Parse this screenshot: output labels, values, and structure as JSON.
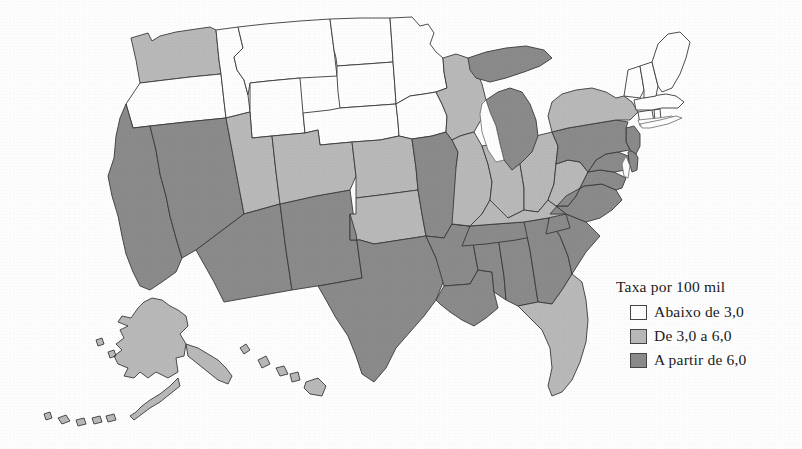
{
  "figure": {
    "kind": "choropleth-map",
    "region": "Estados Unidos"
  },
  "legend": {
    "title": "Taxa por 100 mil",
    "items": [
      {
        "label": "Abaixo de 3,0",
        "color": "#fdfdfd",
        "swatch_name": "swatch-low"
      },
      {
        "label": "De 3,0 a 6,0",
        "color": "#b8b8b8",
        "swatch_name": "swatch-mid"
      },
      {
        "label": "A partir de 6,0",
        "color": "#8a8a8a",
        "swatch_name": "swatch-high"
      }
    ]
  },
  "colors": {
    "low": "#fdfdfd",
    "mid": "#b8b8b8",
    "high": "#8a8a8a",
    "border": "#3a3a3a",
    "background": "#fdfdfd"
  },
  "map_data": {
    "type": "choropleth",
    "classes": [
      "Abaixo de 3,0",
      "De 3,0 a 6,0",
      "A partir de 6,0"
    ],
    "states": [
      {
        "code": "WA",
        "class": "De 3,0 a 6,0",
        "color": "#b8b8b8"
      },
      {
        "code": "OR",
        "class": "Abaixo de 3,0",
        "color": "#fdfdfd"
      },
      {
        "code": "ID",
        "class": "Abaixo de 3,0",
        "color": "#fdfdfd"
      },
      {
        "code": "MT",
        "class": "Abaixo de 3,0",
        "color": "#fdfdfd"
      },
      {
        "code": "WY",
        "class": "Abaixo de 3,0",
        "color": "#fdfdfd"
      },
      {
        "code": "ND",
        "class": "Abaixo de 3,0",
        "color": "#fdfdfd"
      },
      {
        "code": "SD",
        "class": "Abaixo de 3,0",
        "color": "#fdfdfd"
      },
      {
        "code": "NE",
        "class": "Abaixo de 3,0",
        "color": "#fdfdfd"
      },
      {
        "code": "MN",
        "class": "Abaixo de 3,0",
        "color": "#fdfdfd"
      },
      {
        "code": "IA",
        "class": "Abaixo de 3,0",
        "color": "#fdfdfd"
      },
      {
        "code": "CA",
        "class": "A partir de 6,0",
        "color": "#8a8a8a"
      },
      {
        "code": "NV",
        "class": "A partir de 6,0",
        "color": "#8a8a8a"
      },
      {
        "code": "UT",
        "class": "De 3,0 a 6,0",
        "color": "#b8b8b8"
      },
      {
        "code": "AZ",
        "class": "A partir de 6,0",
        "color": "#8a8a8a"
      },
      {
        "code": "NM",
        "class": "A partir de 6,0",
        "color": "#8a8a8a"
      },
      {
        "code": "CO",
        "class": "De 3,0 a 6,0",
        "color": "#b8b8b8"
      },
      {
        "code": "KS",
        "class": "De 3,0 a 6,0",
        "color": "#b8b8b8"
      },
      {
        "code": "OK",
        "class": "De 3,0 a 6,0",
        "color": "#b8b8b8"
      },
      {
        "code": "TX",
        "class": "A partir de 6,0",
        "color": "#8a8a8a"
      },
      {
        "code": "MO",
        "class": "A partir de 6,0",
        "color": "#8a8a8a"
      },
      {
        "code": "AR",
        "class": "A partir de 6,0",
        "color": "#8a8a8a"
      },
      {
        "code": "LA",
        "class": "A partir de 6,0",
        "color": "#8a8a8a"
      },
      {
        "code": "MS",
        "class": "A partir de 6,0",
        "color": "#8a8a8a"
      },
      {
        "code": "AL",
        "class": "A partir de 6,0",
        "color": "#8a8a8a"
      },
      {
        "code": "TN",
        "class": "A partir de 6,0",
        "color": "#8a8a8a"
      },
      {
        "code": "GA",
        "class": "A partir de 6,0",
        "color": "#8a8a8a"
      },
      {
        "code": "SC",
        "class": "A partir de 6,0",
        "color": "#8a8a8a"
      },
      {
        "code": "NC",
        "class": "A partir de 6,0",
        "color": "#8a8a8a"
      },
      {
        "code": "FL",
        "class": "De 3,0 a 6,0",
        "color": "#b8b8b8"
      },
      {
        "code": "WI",
        "class": "De 3,0 a 6,0",
        "color": "#b8b8b8"
      },
      {
        "code": "IL",
        "class": "De 3,0 a 6,0",
        "color": "#b8b8b8"
      },
      {
        "code": "IN",
        "class": "De 3,0 a 6,0",
        "color": "#b8b8b8"
      },
      {
        "code": "OH",
        "class": "De 3,0 a 6,0",
        "color": "#b8b8b8"
      },
      {
        "code": "KY",
        "class": "De 3,0 a 6,0",
        "color": "#b8b8b8"
      },
      {
        "code": "WV",
        "class": "De 3,0 a 6,0",
        "color": "#b8b8b8"
      },
      {
        "code": "MI",
        "class": "A partir de 6,0",
        "color": "#8a8a8a"
      },
      {
        "code": "VA",
        "class": "A partir de 6,0",
        "color": "#8a8a8a"
      },
      {
        "code": "MD",
        "class": "A partir de 6,0",
        "color": "#8a8a8a"
      },
      {
        "code": "DE",
        "class": "A partir de 6,0",
        "color": "#8a8a8a"
      },
      {
        "code": "NJ",
        "class": "A partir de 6,0",
        "color": "#8a8a8a"
      },
      {
        "code": "PA",
        "class": "A partir de 6,0",
        "color": "#8a8a8a"
      },
      {
        "code": "NY",
        "class": "De 3,0 a 6,0",
        "color": "#b8b8b8"
      },
      {
        "code": "CT",
        "class": "Abaixo de 3,0",
        "color": "#fdfdfd"
      },
      {
        "code": "RI",
        "class": "Abaixo de 3,0",
        "color": "#fdfdfd"
      },
      {
        "code": "MA",
        "class": "Abaixo de 3,0",
        "color": "#fdfdfd"
      },
      {
        "code": "VT",
        "class": "Abaixo de 3,0",
        "color": "#fdfdfd"
      },
      {
        "code": "NH",
        "class": "Abaixo de 3,0",
        "color": "#fdfdfd"
      },
      {
        "code": "ME",
        "class": "Abaixo de 3,0",
        "color": "#fdfdfd"
      },
      {
        "code": "AK",
        "class": "De 3,0 a 6,0",
        "color": "#b8b8b8"
      },
      {
        "code": "HI",
        "class": "De 3,0 a 6,0",
        "color": "#b8b8b8"
      }
    ]
  }
}
